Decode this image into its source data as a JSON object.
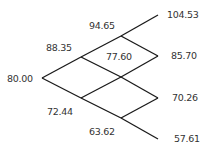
{
  "diagram": {
    "type": "binomial-tree",
    "steps": 3,
    "line_color": "#1a1a1a",
    "text_color": "#333333",
    "nodes": [
      {
        "id": "n0",
        "label": "80.00",
        "x": 42,
        "y": 78,
        "lx": 7,
        "ly": 79
      },
      {
        "id": "u",
        "label": "88.35",
        "x": 81,
        "y": 57,
        "lx": 46,
        "ly": 48
      },
      {
        "id": "d",
        "label": "72.44",
        "x": 81,
        "y": 98,
        "lx": 47,
        "ly": 112
      },
      {
        "id": "uu",
        "label": "94.65",
        "x": 121,
        "y": 36,
        "lx": 89,
        "ly": 26
      },
      {
        "id": "ud",
        "label": "77.60",
        "x": 121,
        "y": 77,
        "lx": 106,
        "ly": 57
      },
      {
        "id": "dd",
        "label": "63.62",
        "x": 121,
        "y": 118,
        "lx": 89,
        "ly": 132
      },
      {
        "id": "uuu",
        "label": "104.53",
        "x": 158,
        "y": 15,
        "lx": 167,
        "ly": 15
      },
      {
        "id": "uud",
        "label": "85.70",
        "x": 158,
        "y": 56,
        "lx": 171,
        "ly": 56
      },
      {
        "id": "udd",
        "label": "70.26",
        "x": 158,
        "y": 98,
        "lx": 172,
        "ly": 98
      },
      {
        "id": "ddd",
        "label": "57.61",
        "x": 158,
        "y": 139,
        "lx": 174,
        "ly": 139
      }
    ],
    "edges": [
      [
        "n0",
        "u"
      ],
      [
        "n0",
        "d"
      ],
      [
        "u",
        "uu"
      ],
      [
        "u",
        "ud"
      ],
      [
        "d",
        "ud"
      ],
      [
        "d",
        "dd"
      ],
      [
        "uu",
        "uuu"
      ],
      [
        "uu",
        "uud"
      ],
      [
        "ud",
        "uud"
      ],
      [
        "ud",
        "udd"
      ],
      [
        "dd",
        "udd"
      ],
      [
        "dd",
        "ddd"
      ]
    ]
  }
}
